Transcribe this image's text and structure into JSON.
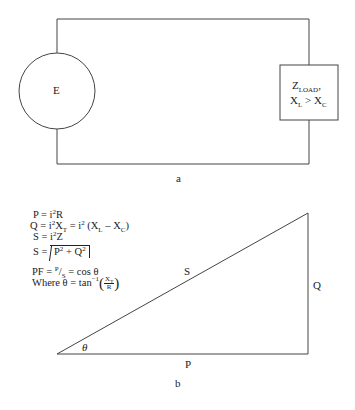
{
  "figure_a": {
    "source_label": "E",
    "load_label_main": "Z",
    "load_label_sub": "LOAD",
    "load_label_trail": ",",
    "load_condition": {
      "left": "X",
      "left_sub": "L",
      "op": " > ",
      "right": "X",
      "right_sub": "C"
    },
    "caption": "a"
  },
  "figure_b": {
    "equations": {
      "p": {
        "lhs": "P = i",
        "exp": "2",
        "rhs": "R"
      },
      "q": {
        "lhs": "Q = i",
        "exp": "2",
        "mid": "X",
        "mid_sub": "T",
        "eq2": " = i",
        "exp2": "2",
        "paren_open": " (X",
        "sub_l": "L",
        "minus": " – X",
        "sub_c": "C",
        "paren_close": ")"
      },
      "s1": {
        "lhs": "S = i",
        "exp": "2",
        "rhs": "Z"
      },
      "s2": {
        "lhs": "S = ",
        "p": "P",
        "p_exp": "2",
        "plus": " + Q",
        "q_exp": "2"
      },
      "pf": {
        "lhs": "PF = ",
        "num": "P",
        "slash": "/",
        "den": "S",
        "rhs": " = cos θ"
      },
      "where": {
        "lhs": "Where θ = tan",
        "exp": "−1",
        "num": "X",
        "num_sub": "T",
        "den": "R"
      }
    },
    "triangle_labels": {
      "hypotenuse": "S",
      "opposite": "Q",
      "adjacent": "P",
      "angle": "θ"
    },
    "caption": "b"
  }
}
